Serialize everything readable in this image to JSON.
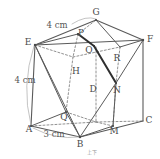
{
  "figure": {
    "type": "geometry-solid-diagram",
    "colors": {
      "stroke": "#555555",
      "dashed": "#6e6e6e",
      "bold": "#2a2a2a",
      "text": "#4a4a4a",
      "background": "#ffffff"
    },
    "vertex_labels": [
      {
        "name": "G",
        "text": "G",
        "x": 96,
        "y": 12
      },
      {
        "name": "E",
        "text": "E",
        "x": 28,
        "y": 42
      },
      {
        "name": "F",
        "text": "F",
        "x": 150,
        "y": 39
      },
      {
        "name": "P",
        "text": "P",
        "x": 81,
        "y": 33
      },
      {
        "name": "O",
        "text": "O",
        "x": 89,
        "y": 50
      },
      {
        "name": "R",
        "text": "R",
        "x": 117,
        "y": 58
      },
      {
        "name": "H",
        "text": "H",
        "x": 76,
        "y": 71
      },
      {
        "name": "D",
        "text": "D",
        "x": 93,
        "y": 89
      },
      {
        "name": "N",
        "text": "N",
        "x": 117,
        "y": 90
      },
      {
        "name": "Q",
        "text": "Q",
        "x": 64,
        "y": 117
      },
      {
        "name": "C",
        "text": "C",
        "x": 149,
        "y": 120
      },
      {
        "name": "A",
        "text": "A",
        "x": 29,
        "y": 129
      },
      {
        "name": "M",
        "text": "M",
        "x": 114,
        "y": 131
      },
      {
        "name": "B",
        "text": "B",
        "x": 80,
        "y": 144
      }
    ],
    "dimension_labels": [
      {
        "name": "top-edge-length",
        "text": "4 cm",
        "x": 57,
        "y": 25
      },
      {
        "name": "left-edge-length",
        "text": "4 cm",
        "x": 25,
        "y": 80
      },
      {
        "name": "bottom-edge-length",
        "text": "3 cm",
        "x": 54,
        "y": 134
      }
    ],
    "watermark": {
      "name": "watermark",
      "text": "上下",
      "x": 92,
      "y": 152
    }
  }
}
